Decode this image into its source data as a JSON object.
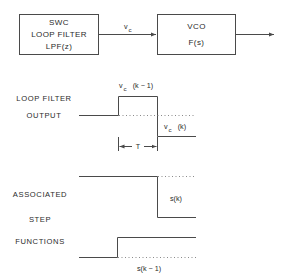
{
  "block_diagram": {
    "filter_box": {
      "lines": [
        "SWC",
        "LOOP FILTER",
        "LPF(z)"
      ]
    },
    "connection_label": {
      "main": "v",
      "subscript": "c"
    },
    "vco_box": {
      "lines": [
        "VCO",
        "F(s)"
      ]
    }
  },
  "loop_filter_output": {
    "label_lines": [
      "LOOP FILTER",
      "OUTPUT"
    ],
    "upper_level_label": {
      "main": "v",
      "subscript": "c",
      "arg": "(k − 1)"
    },
    "lower_level_label": {
      "main": "v",
      "subscript": "c",
      "arg": "(k)"
    },
    "period_label": "T"
  },
  "step_functions": {
    "label_lines": [
      "ASSOCIATED",
      "STEP",
      "FUNCTIONS"
    ],
    "falling_step_label": "s(k)",
    "rising_step_label": "s(k − 1)"
  },
  "colors": {
    "line": "#4a4a4a",
    "text": "#2a2a2a",
    "dotted": "#8a8a8a",
    "background": "#ffffff"
  }
}
